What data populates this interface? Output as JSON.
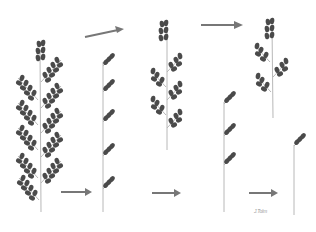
{
  "figure": {
    "stages": [
      {
        "id": 1,
        "label": "Full panicle",
        "branches": 10
      },
      {
        "id": 2,
        "label": "Sparse sprigs",
        "branches": 5
      },
      {
        "id": 3,
        "label": "Partially clustered panicle",
        "branches": 5
      },
      {
        "id": 4,
        "label": "Reduced panicle",
        "branches": 3
      },
      {
        "id": 5,
        "label": "Few sprigs",
        "branches": 3
      },
      {
        "id": 6,
        "label": "Single terminal sprig",
        "branches": 1
      }
    ],
    "arrows": 5,
    "signature": "J.Tolm"
  },
  "colors": {
    "background": "#ffffff",
    "seed": "#4a4a4a",
    "stem": "#b8b8b8",
    "arrow": "#777777"
  }
}
